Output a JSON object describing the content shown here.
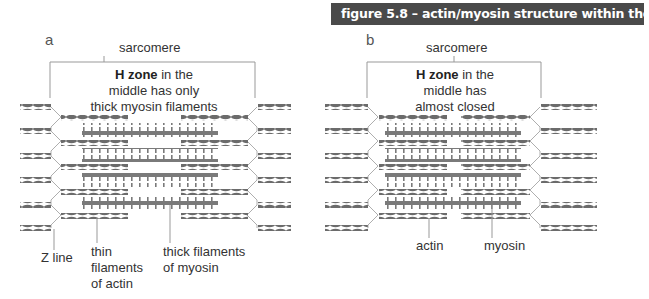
{
  "figure": {
    "title": "figure 5.8 – actin/myosin structure within the sarcomere",
    "banner_bg": "#4a4a4a",
    "filament_color": "#6b6b6b",
    "line_color": "#999999"
  },
  "panel_a": {
    "letter": "a",
    "sarcomere_label": "sarcomere",
    "h_zone_bold": "H zone",
    "h_zone_rest_line1": " in the",
    "h_zone_line2": "middle has only",
    "h_zone_line3": "thick myosin filaments",
    "labels": {
      "z_line": "Z line",
      "thin_line1": "thin",
      "thin_line2": "filaments",
      "thin_line3": "of actin",
      "thick_line1": "thick filaments",
      "thick_line2": "of myosin"
    }
  },
  "panel_b": {
    "letter": "b",
    "sarcomere_label": "sarcomere",
    "h_zone_bold": "H zone",
    "h_zone_rest_line1": " in the",
    "h_zone_line2": "middle has",
    "h_zone_line3": "almost closed",
    "labels": {
      "actin": "actin",
      "myosin": "myosin"
    }
  }
}
